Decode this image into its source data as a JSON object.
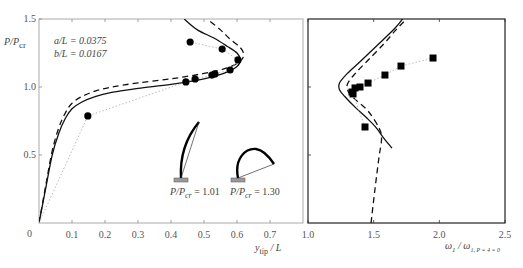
{
  "chart_data": [
    {
      "type": "line",
      "panel": "left",
      "title": "",
      "xlabel": "y_tip / L",
      "ylabel": "P/P_cr",
      "xlim": [
        0,
        0.8
      ],
      "ylim": [
        0,
        1.5
      ],
      "xticks": [
        "0",
        "0.1",
        "0.2",
        "0.3",
        "0.4",
        "0.5",
        "0.6",
        "0.7"
      ],
      "yticks": [
        "0.5",
        "1.0",
        "1.5"
      ],
      "grid": false,
      "annotations": {
        "params": [
          "a/L = 0.0375",
          "b/L = 0.0167"
        ],
        "inset_labels": [
          "P/P_cr = 1.01",
          "P/P_cr = 1.30"
        ]
      },
      "series": [
        {
          "name": "theory-solid",
          "style": "solid",
          "x": [
            0.0,
            0.02,
            0.04,
            0.06,
            0.08,
            0.1,
            0.13,
            0.17,
            0.22,
            0.3,
            0.4,
            0.5,
            0.56,
            0.6,
            0.61,
            0.6,
            0.57,
            0.53,
            0.48,
            0.44
          ],
          "y": [
            0.0,
            0.25,
            0.5,
            0.66,
            0.77,
            0.84,
            0.89,
            0.93,
            0.96,
            0.99,
            1.02,
            1.06,
            1.1,
            1.15,
            1.2,
            1.25,
            1.3,
            1.36,
            1.42,
            1.5
          ]
        },
        {
          "name": "theory-dashed",
          "style": "dashed",
          "x": [
            0.0,
            0.02,
            0.04,
            0.06,
            0.08,
            0.1,
            0.13,
            0.17,
            0.22,
            0.3,
            0.4,
            0.5,
            0.57,
            0.61,
            0.62,
            0.61,
            0.58,
            0.55,
            0.51
          ],
          "y": [
            0.0,
            0.27,
            0.53,
            0.7,
            0.81,
            0.88,
            0.93,
            0.97,
            1.0,
            1.03,
            1.06,
            1.1,
            1.14,
            1.19,
            1.24,
            1.29,
            1.35,
            1.42,
            1.5
          ]
        },
        {
          "name": "experiment",
          "style": "markers-circle",
          "x": [
            0.0,
            0.148,
            0.445,
            0.473,
            0.524,
            0.533,
            0.579,
            0.603,
            0.555,
            0.458
          ],
          "y": [
            0.0,
            0.787,
            1.037,
            1.059,
            1.088,
            1.096,
            1.125,
            1.199,
            1.279,
            1.331
          ]
        }
      ]
    },
    {
      "type": "line",
      "panel": "right",
      "title": "",
      "xlabel": "ω_1 / ω_1,P=4=0",
      "ylabel": "",
      "xlim": [
        1.0,
        2.5
      ],
      "ylim": [
        0,
        1.5
      ],
      "xticks": [
        "1.0",
        "1.5",
        "2.0",
        "2.5"
      ],
      "yticks": [],
      "grid": false,
      "series": [
        {
          "name": "theory-solid",
          "style": "solid",
          "x": [
            1.64,
            1.58,
            1.52,
            1.45,
            1.36,
            1.28,
            1.24,
            1.24,
            1.3,
            1.4,
            1.52,
            1.66,
            1.72
          ],
          "y": [
            0.55,
            0.62,
            0.7,
            0.77,
            0.85,
            0.93,
            0.98,
            1.03,
            1.1,
            1.19,
            1.3,
            1.43,
            1.5
          ]
        },
        {
          "name": "theory-dashed",
          "style": "dashed",
          "x": [
            1.48,
            1.51,
            1.54,
            1.56,
            1.54,
            1.46,
            1.37,
            1.31,
            1.3,
            1.36,
            1.46,
            1.58,
            1.67,
            1.75
          ],
          "y": [
            0.0,
            0.25,
            0.48,
            0.62,
            0.7,
            0.82,
            0.9,
            0.96,
            1.02,
            1.1,
            1.2,
            1.32,
            1.42,
            1.5
          ]
        },
        {
          "name": "experiment",
          "style": "markers-square",
          "x": [
            1.434,
            1.343,
            1.335,
            1.358,
            1.396,
            1.457,
            1.586,
            1.708,
            1.952
          ],
          "y": [
            0.706,
            0.949,
            0.963,
            0.993,
            1.0,
            1.029,
            1.088,
            1.154,
            1.213
          ]
        }
      ]
    }
  ],
  "labels": {
    "left_ylabel_main": "P/P",
    "left_ylabel_sub": "cr",
    "left_xlabel_main": "y",
    "left_xlabel_sub": "tip",
    "left_xlabel_tail": " / L",
    "param_a": "a/L = 0.0375",
    "param_b": "b/L = 0.0167",
    "inset1_main": "P/P",
    "inset1_sub": "cr",
    "inset1_value": " = 1.01",
    "inset2_main": "P/P",
    "inset2_sub": "cr",
    "inset2_value": " = 1.30",
    "right_xlabel_main": "ω",
    "right_xlabel_sub1": "1",
    "right_xlabel_mid": " / ω",
    "right_xlabel_sub2": "1, P = 4 = 0",
    "origin": "0"
  },
  "colors": {
    "curve": "#111111",
    "marker": "#000000",
    "exp_line": "#bbbbbb",
    "left_axis": "#999999",
    "right_axis": "#222222",
    "clamp": "#999999"
  }
}
